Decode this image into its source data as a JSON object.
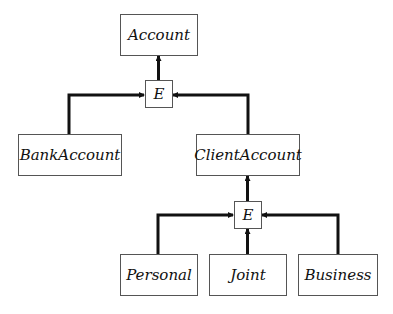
{
  "diagram": {
    "type": "inheritance-tree",
    "nodes": {
      "account": "Account",
      "e_top": "E",
      "bank_account": "BankAccount",
      "client_account": "ClientAccount",
      "e_bottom": "E",
      "personal": "Personal",
      "joint": "Joint",
      "business": "Business"
    },
    "edges": [
      {
        "from": "e_top",
        "to": "account"
      },
      {
        "from": "bank_account",
        "to": "e_top"
      },
      {
        "from": "client_account",
        "to": "e_top"
      },
      {
        "from": "e_bottom",
        "to": "client_account"
      },
      {
        "from": "personal",
        "to": "e_bottom"
      },
      {
        "from": "joint",
        "to": "e_bottom"
      },
      {
        "from": "business",
        "to": "e_bottom"
      }
    ]
  }
}
